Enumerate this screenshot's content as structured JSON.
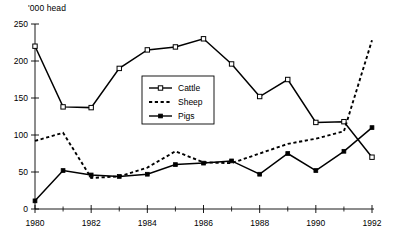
{
  "chart_data": {
    "type": "line",
    "title": "",
    "subtitle": "",
    "xlabel": "",
    "ylabel": "'000 head",
    "unit_label": "'000 head",
    "x": [
      1980,
      1981,
      1982,
      1983,
      1984,
      1985,
      1986,
      1987,
      1988,
      1989,
      1990,
      1991,
      1992
    ],
    "xlim": [
      1980,
      1992
    ],
    "ylim": [
      0,
      250
    ],
    "xticks": [
      1980,
      1982,
      1984,
      1986,
      1988,
      1990,
      1992
    ],
    "xtick_labels": [
      "1980",
      "1982",
      "1984",
      "1986",
      "1988",
      "1990",
      "1992"
    ],
    "xminor_ticks": [
      1981,
      1983,
      1985,
      1987,
      1989,
      1991
    ],
    "yticks": [
      0,
      50,
      100,
      150,
      200,
      250
    ],
    "ytick_labels": [
      "0",
      "50",
      "100",
      "150",
      "200",
      "250"
    ],
    "grid": false,
    "legend_position": "center",
    "series": [
      {
        "name": "Cattle",
        "style": "solid",
        "marker": "open-square",
        "color": "#000000",
        "values": [
          220,
          138,
          137,
          190,
          215,
          219,
          230,
          196,
          152,
          175,
          117,
          118,
          70
        ]
      },
      {
        "name": "Sheep",
        "style": "dashed",
        "marker": "none",
        "color": "#000000",
        "values": [
          92,
          103,
          42,
          44,
          56,
          78,
          63,
          62,
          75,
          88,
          95,
          105,
          228
        ]
      },
      {
        "name": "Pigs",
        "style": "solid",
        "marker": "filled-square",
        "color": "#000000",
        "values": [
          11,
          52,
          46,
          44,
          47,
          60,
          62,
          65,
          47,
          75,
          52,
          78,
          110
        ]
      }
    ]
  },
  "legend": {
    "items": [
      {
        "label": "Cattle"
      },
      {
        "label": "Sheep"
      },
      {
        "label": "Pigs"
      }
    ]
  }
}
